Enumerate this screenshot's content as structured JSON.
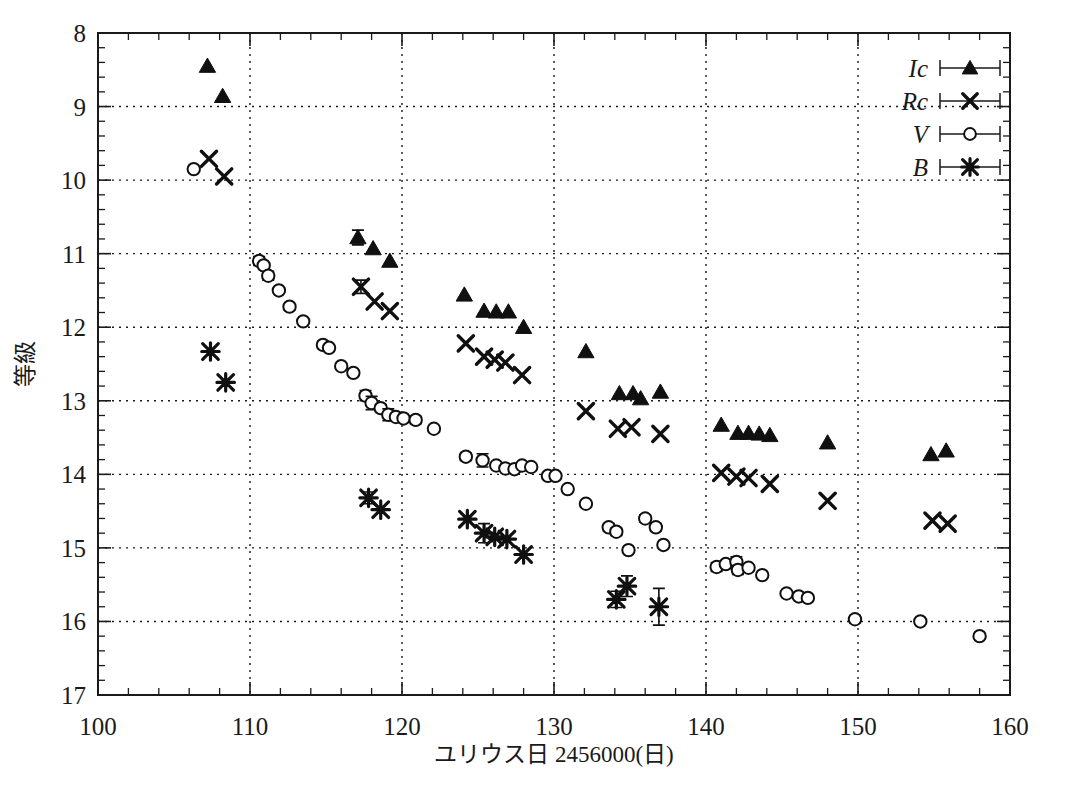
{
  "chart_data": {
    "type": "scatter",
    "title": "",
    "xlabel": "ユリウス日 2456000(日)",
    "ylabel": "等級",
    "xlim": [
      100,
      160
    ],
    "ylim": [
      17,
      8
    ],
    "y_inverted": true,
    "grid": true,
    "x_ticks": [
      100,
      110,
      120,
      130,
      140,
      150,
      160
    ],
    "x_tick_labels": [
      "100",
      "110",
      "120",
      "130",
      "140",
      "150",
      "160"
    ],
    "x_minor_tick_step": 2,
    "y_ticks": [
      8,
      9,
      10,
      11,
      12,
      13,
      14,
      15,
      16,
      17
    ],
    "y_tick_labels": [
      "8",
      "9",
      "10",
      "11",
      "12",
      "13",
      "14",
      "15",
      "16",
      "17"
    ],
    "y_minor_tick_step": 0.2,
    "legend_position": "top-right",
    "legend": [
      {
        "name": "Ic",
        "marker": "filled-triangle"
      },
      {
        "name": "Rc",
        "marker": "cross-x"
      },
      {
        "name": "V",
        "marker": "open-circle"
      },
      {
        "name": "B",
        "marker": "asterisk"
      }
    ],
    "series": [
      {
        "name": "Ic",
        "marker": "filled-triangle",
        "color": "#101010",
        "points": [
          {
            "x": 107.2,
            "y": 8.45
          },
          {
            "x": 108.2,
            "y": 8.86
          },
          {
            "x": 117.1,
            "y": 10.78,
            "yerr": 0.1
          },
          {
            "x": 118.1,
            "y": 10.93
          },
          {
            "x": 119.2,
            "y": 11.1
          },
          {
            "x": 124.1,
            "y": 11.56
          },
          {
            "x": 125.4,
            "y": 11.78
          },
          {
            "x": 126.2,
            "y": 11.79
          },
          {
            "x": 127.0,
            "y": 11.79
          },
          {
            "x": 128.0,
            "y": 12.0
          },
          {
            "x": 132.1,
            "y": 12.33
          },
          {
            "x": 134.3,
            "y": 12.9
          },
          {
            "x": 135.2,
            "y": 12.9
          },
          {
            "x": 135.7,
            "y": 12.97
          },
          {
            "x": 137.0,
            "y": 12.88
          },
          {
            "x": 141.0,
            "y": 13.33
          },
          {
            "x": 142.1,
            "y": 13.44
          },
          {
            "x": 142.8,
            "y": 13.44
          },
          {
            "x": 143.5,
            "y": 13.45
          },
          {
            "x": 144.2,
            "y": 13.47
          },
          {
            "x": 148.0,
            "y": 13.57
          },
          {
            "x": 154.8,
            "y": 13.73
          },
          {
            "x": 155.8,
            "y": 13.68
          }
        ]
      },
      {
        "name": "Rc",
        "marker": "cross-x",
        "color": "#101010",
        "points": [
          {
            "x": 107.3,
            "y": 9.71
          },
          {
            "x": 108.3,
            "y": 9.95
          },
          {
            "x": 117.3,
            "y": 11.45,
            "yerr": 0.09
          },
          {
            "x": 118.2,
            "y": 11.65
          },
          {
            "x": 119.2,
            "y": 11.78
          },
          {
            "x": 124.2,
            "y": 12.22
          },
          {
            "x": 125.4,
            "y": 12.4
          },
          {
            "x": 126.1,
            "y": 12.44
          },
          {
            "x": 126.8,
            "y": 12.48
          },
          {
            "x": 127.9,
            "y": 12.65
          },
          {
            "x": 132.1,
            "y": 13.14
          },
          {
            "x": 134.2,
            "y": 13.38
          },
          {
            "x": 135.1,
            "y": 13.36
          },
          {
            "x": 137.0,
            "y": 13.45
          },
          {
            "x": 141.0,
            "y": 13.98
          },
          {
            "x": 142.0,
            "y": 14.03
          },
          {
            "x": 142.8,
            "y": 14.05
          },
          {
            "x": 144.2,
            "y": 14.13
          },
          {
            "x": 148.0,
            "y": 14.36
          },
          {
            "x": 154.9,
            "y": 14.63
          },
          {
            "x": 155.9,
            "y": 14.67
          }
        ]
      },
      {
        "name": "V",
        "marker": "open-circle",
        "color": "#101010",
        "points": [
          {
            "x": 106.3,
            "y": 9.85
          },
          {
            "x": 110.6,
            "y": 11.1,
            "yerr": 0.06
          },
          {
            "x": 110.9,
            "y": 11.16
          },
          {
            "x": 111.2,
            "y": 11.3,
            "yerr": 0.06
          },
          {
            "x": 111.9,
            "y": 11.5
          },
          {
            "x": 112.6,
            "y": 11.72
          },
          {
            "x": 113.5,
            "y": 11.92
          },
          {
            "x": 114.8,
            "y": 12.24,
            "yerr": 0.05
          },
          {
            "x": 115.2,
            "y": 12.28
          },
          {
            "x": 116.0,
            "y": 12.53
          },
          {
            "x": 116.8,
            "y": 12.62
          },
          {
            "x": 117.6,
            "y": 12.93,
            "yerr": 0.07
          },
          {
            "x": 118.0,
            "y": 13.03,
            "yerr": 0.09
          },
          {
            "x": 118.6,
            "y": 13.1,
            "yerr": 0.05
          },
          {
            "x": 119.1,
            "y": 13.19,
            "yerr": 0.08
          },
          {
            "x": 119.6,
            "y": 13.22
          },
          {
            "x": 120.1,
            "y": 13.24
          },
          {
            "x": 120.9,
            "y": 13.26,
            "yerr": 0.05
          },
          {
            "x": 122.1,
            "y": 13.38
          },
          {
            "x": 124.2,
            "y": 13.76,
            "yerr": 0.05
          },
          {
            "x": 125.3,
            "y": 13.81,
            "yerr": 0.09
          },
          {
            "x": 126.2,
            "y": 13.88
          },
          {
            "x": 126.8,
            "y": 13.92
          },
          {
            "x": 127.4,
            "y": 13.93
          },
          {
            "x": 127.9,
            "y": 13.88
          },
          {
            "x": 128.5,
            "y": 13.9
          },
          {
            "x": 129.6,
            "y": 14.02,
            "yerr": 0.04
          },
          {
            "x": 130.1,
            "y": 14.02
          },
          {
            "x": 130.9,
            "y": 14.2
          },
          {
            "x": 132.1,
            "y": 14.4
          },
          {
            "x": 133.6,
            "y": 14.72,
            "yerr": 0.05
          },
          {
            "x": 134.1,
            "y": 14.78,
            "yerr": 0.05
          },
          {
            "x": 134.9,
            "y": 15.03
          },
          {
            "x": 136.0,
            "y": 14.6,
            "yerr": 0.05
          },
          {
            "x": 136.7,
            "y": 14.72,
            "yerr": 0.05
          },
          {
            "x": 137.2,
            "y": 14.96
          },
          {
            "x": 140.7,
            "y": 15.26,
            "yerr": 0.06
          },
          {
            "x": 141.3,
            "y": 15.22
          },
          {
            "x": 142.0,
            "y": 15.19,
            "yerr": 0.07
          },
          {
            "x": 142.1,
            "y": 15.3,
            "yerr": 0.06
          },
          {
            "x": 142.8,
            "y": 15.27
          },
          {
            "x": 143.7,
            "y": 15.37
          },
          {
            "x": 145.3,
            "y": 15.62
          },
          {
            "x": 146.1,
            "y": 15.66
          },
          {
            "x": 146.7,
            "y": 15.68
          },
          {
            "x": 149.8,
            "y": 15.97,
            "yerr": 0.05
          },
          {
            "x": 154.1,
            "y": 16.0
          },
          {
            "x": 158.0,
            "y": 16.2
          }
        ]
      },
      {
        "name": "B",
        "marker": "asterisk",
        "color": "#101010",
        "points": [
          {
            "x": 107.4,
            "y": 12.33
          },
          {
            "x": 108.4,
            "y": 12.75
          },
          {
            "x": 117.8,
            "y": 14.32,
            "yerr": 0.08
          },
          {
            "x": 118.6,
            "y": 14.48
          },
          {
            "x": 124.3,
            "y": 14.61
          },
          {
            "x": 125.4,
            "y": 14.8,
            "yerr": 0.13
          },
          {
            "x": 126.1,
            "y": 14.85
          },
          {
            "x": 126.9,
            "y": 14.88
          },
          {
            "x": 128.0,
            "y": 15.09
          },
          {
            "x": 134.1,
            "y": 15.7,
            "yerr": 0.11
          },
          {
            "x": 134.8,
            "y": 15.52,
            "yerr": 0.14
          },
          {
            "x": 136.9,
            "y": 15.8,
            "yerr": 0.25
          }
        ]
      }
    ]
  },
  "figure": {
    "caption": ""
  }
}
